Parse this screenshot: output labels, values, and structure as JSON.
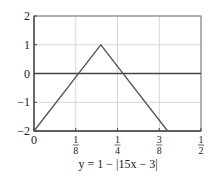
{
  "chart_data": {
    "type": "line",
    "title": "",
    "caption": "y = 1 − |15x − 3|",
    "xlabel": "",
    "ylabel": "",
    "xlim": [
      0,
      0.5
    ],
    "ylim": [
      -2,
      2
    ],
    "grid": true,
    "x_ticks": [
      {
        "value": 0,
        "label": "0"
      },
      {
        "value": 0.125,
        "num": "1",
        "den": "8"
      },
      {
        "value": 0.25,
        "num": "1",
        "den": "4"
      },
      {
        "value": 0.375,
        "num": "3",
        "den": "8"
      },
      {
        "value": 0.5,
        "num": "1",
        "den": "2"
      }
    ],
    "y_ticks": [
      {
        "value": 2,
        "label": "2"
      },
      {
        "value": 1,
        "label": "1"
      },
      {
        "value": 0,
        "label": "0"
      },
      {
        "value": -1,
        "label": "−1"
      },
      {
        "value": -2,
        "label": "−2"
      }
    ],
    "series": [
      {
        "name": "y = 1 − |15x − 3|",
        "x": [
          0,
          0.2,
          0.4
        ],
        "y": [
          -2,
          1,
          -2
        ]
      }
    ],
    "colors": {
      "line": "#555555",
      "axis": "#444444",
      "grid": "#cccccc"
    }
  }
}
